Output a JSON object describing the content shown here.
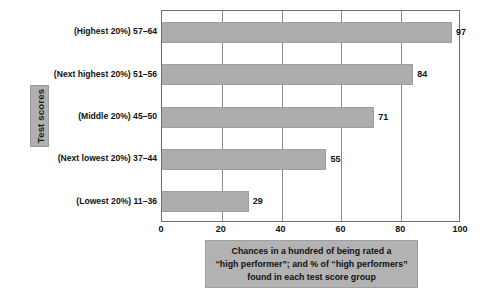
{
  "chart_data": {
    "type": "bar",
    "orientation": "horizontal",
    "title": "",
    "xlabel": "Chances in a hundred of being rated a “high performer”; and % of “high performers” found in each test score group",
    "ylabel": "Test scores",
    "categories": [
      "(Highest 20%) 57–64",
      "(Next highest 20%) 51–56",
      "(Middle 20%) 45–50",
      "(Next lowest 20%) 37–44",
      "(Lowest 20%) 11–36"
    ],
    "values": [
      97,
      84,
      71,
      55,
      29
    ],
    "value_labels": [
      "97",
      "84",
      "71",
      "55",
      "29"
    ],
    "xlim": [
      0,
      100
    ],
    "xticks": [
      0,
      20,
      40,
      60,
      80,
      100
    ],
    "xtick_labels": [
      "0",
      "20",
      "40",
      "60",
      "80",
      "100"
    ],
    "grid": "vertical",
    "legend": "none",
    "colors": {
      "bar_fill": "#adadad",
      "bar_stroke": "#9e9e9e",
      "axis": "#6f6f6f",
      "gridline": "#8c8c8c",
      "label_box": "#b0b0b0",
      "caption_box": "#b2b2b2",
      "text": "#111111",
      "background": "#ffffff"
    }
  },
  "axis_group_label": {
    "text": "Test scores"
  },
  "caption": {
    "line1": "Chances in a hundred of being rated a",
    "line2": "“high performer”; and % of “high performers”",
    "line3": "found in each test score group"
  }
}
